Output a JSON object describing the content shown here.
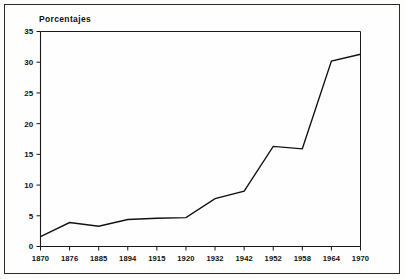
{
  "chart_data": {
    "type": "line",
    "title": "Porcentajes",
    "xlabel": "",
    "ylabel": "",
    "ylim": [
      0,
      35
    ],
    "ytick_values": [
      0,
      5,
      10,
      15,
      20,
      25,
      30,
      35
    ],
    "ytick_labels": [
      "0",
      "5",
      "10",
      "15",
      "20",
      "25",
      "30",
      "35"
    ],
    "categories": [
      "1870",
      "1876",
      "1885",
      "1894",
      "1915",
      "1920",
      "1932",
      "1942",
      "1952",
      "1958",
      "1964",
      "1970"
    ],
    "values": [
      1.6,
      3.9,
      3.3,
      4.4,
      4.6,
      4.7,
      7.8,
      9.0,
      16.3,
      15.9,
      30.2,
      31.3
    ],
    "series": [
      {
        "name": "Porcentajes",
        "values": [
          1.6,
          3.9,
          3.3,
          4.4,
          4.6,
          4.7,
          7.8,
          9.0,
          16.3,
          15.9,
          30.2,
          31.3
        ]
      }
    ],
    "grid": false,
    "legend": false,
    "line_color": "#111111",
    "background_color": "#fefefe",
    "axis_color": "#1a1a1a"
  }
}
